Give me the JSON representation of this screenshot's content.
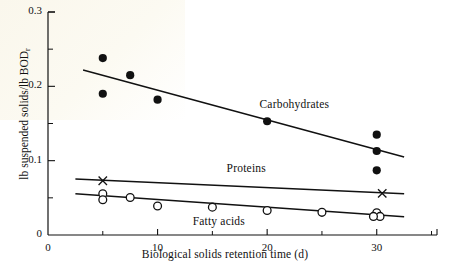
{
  "figure": {
    "background_color": "#ffffff",
    "ink_color": "#111111"
  },
  "chart_data": {
    "type": "scatter",
    "title": "",
    "xlabel": "Biological solids retention time (d)",
    "ylabel": "lb suspended solids/lb BOD",
    "ylabel_subscript": "r",
    "xlim": [
      0,
      35.5
    ],
    "ylim": [
      0,
      0.3
    ],
    "grid": false,
    "legend_position": "inline-annotations",
    "x_ticks": [
      0,
      10,
      20,
      30
    ],
    "x_tick_labels": [
      "0",
      "10",
      "20",
      "30"
    ],
    "x_minor_ticks": [
      5,
      15,
      25,
      35
    ],
    "y_ticks": [
      0,
      0.1,
      0.2,
      0.3
    ],
    "y_tick_labels": [
      "0",
      "0.1",
      "0.2",
      "0.3"
    ],
    "y_minor_ticks": [
      0.05,
      0.15,
      0.25
    ],
    "series": [
      {
        "name": "Carbohydrates",
        "marker": "filled-circle",
        "annotation": "Carbohydrates",
        "annotation_x": 19.3,
        "annotation_y": 0.173,
        "points": [
          {
            "x": 5.0,
            "y": 0.238
          },
          {
            "x": 5.0,
            "y": 0.19
          },
          {
            "x": 7.5,
            "y": 0.215
          },
          {
            "x": 10.0,
            "y": 0.182
          },
          {
            "x": 20.0,
            "y": 0.153
          },
          {
            "x": 30.0,
            "y": 0.135
          },
          {
            "x": 30.0,
            "y": 0.113
          },
          {
            "x": 30.0,
            "y": 0.087
          }
        ],
        "trend_line": {
          "x1": 3.2,
          "y1": 0.222,
          "x2": 32.5,
          "y2": 0.105
        }
      },
      {
        "name": "Proteins",
        "marker": "x-cross",
        "annotation": "Proteins",
        "annotation_x": 16.3,
        "annotation_y": 0.088,
        "points": [
          {
            "x": 5.0,
            "y": 0.073
          },
          {
            "x": 30.5,
            "y": 0.056
          }
        ],
        "trend_line": {
          "x1": 2.5,
          "y1": 0.0755,
          "x2": 32.5,
          "y2": 0.0555
        }
      },
      {
        "name": "Fatty acids",
        "marker": "open-circle",
        "annotation": "Fatty acids",
        "annotation_x": 13.2,
        "annotation_y": 0.016,
        "points": [
          {
            "x": 5.0,
            "y": 0.0555
          },
          {
            "x": 5.0,
            "y": 0.0475
          },
          {
            "x": 7.5,
            "y": 0.0505
          },
          {
            "x": 10.0,
            "y": 0.039
          },
          {
            "x": 15.0,
            "y": 0.0375
          },
          {
            "x": 20.0,
            "y": 0.033
          },
          {
            "x": 25.0,
            "y": 0.0305
          },
          {
            "x": 30.0,
            "y": 0.03
          },
          {
            "x": 30.3,
            "y": 0.025
          },
          {
            "x": 29.7,
            "y": 0.025
          }
        ],
        "trend_line": {
          "x1": 2.5,
          "y1": 0.0555,
          "x2": 32.5,
          "y2": 0.0245
        }
      }
    ]
  }
}
